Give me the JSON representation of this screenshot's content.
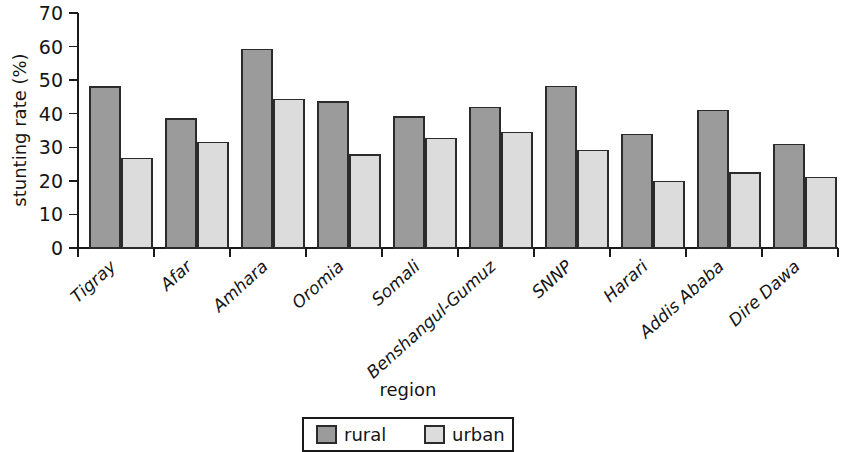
{
  "chart_data": {
    "type": "bar",
    "title": "",
    "xlabel": "region",
    "ylabel": "stunting rate (%)",
    "categories": [
      "Tigray",
      "Afar",
      "Amhara",
      "Oromia",
      "Somali",
      "Benshangul-Gumuz",
      "SNNP",
      "Harari",
      "Addis Ababa",
      "Dire Dawa"
    ],
    "series": [
      {
        "name": "rural",
        "color": "#9b9b9b",
        "values": [
          48.0,
          38.4,
          59.2,
          43.5,
          39.0,
          41.8,
          48.2,
          33.8,
          41.0,
          30.8
        ]
      },
      {
        "name": "urban",
        "color": "#dcdcdc",
        "values": [
          26.6,
          31.5,
          44.2,
          27.7,
          32.7,
          34.4,
          29.1,
          19.8,
          22.3,
          21.0
        ]
      }
    ],
    "ylim": [
      0,
      70
    ],
    "yticks": [
      0,
      10,
      20,
      30,
      40,
      50,
      60,
      70
    ],
    "ytick_labels": [
      "0",
      "10",
      "20",
      "30",
      "40",
      "50",
      "60",
      "70"
    ],
    "grid": false,
    "legend_position": "bottom-center",
    "legend_entries": [
      "rural",
      "urban"
    ],
    "bar_border_color": "#2b2b2b",
    "axis_color": "#1a1a1a"
  }
}
